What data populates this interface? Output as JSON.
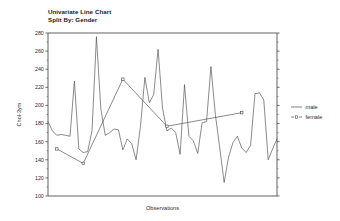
{
  "chart_data": {
    "type": "line",
    "title": "Univariate Line Chart",
    "subtitle": "Split By: Gender",
    "xlabel": "Observations",
    "ylabel": "Chol-3ym",
    "ylim": [
      100,
      280
    ],
    "ytick_step": 20,
    "yticks": [
      100,
      120,
      140,
      160,
      180,
      200,
      220,
      240,
      260,
      280
    ],
    "ytick_labels": [
      "100",
      "120",
      "140",
      "160",
      "180",
      "200",
      "220",
      "240",
      "260",
      "280"
    ],
    "xticks_visible": false,
    "grid": false,
    "legend_position": "right",
    "series": [
      {
        "name": "male",
        "style": "solid",
        "marker": "none",
        "color": "#4a4a52",
        "x": [
          0,
          1,
          2,
          3,
          4,
          5,
          6,
          7,
          8,
          9,
          10,
          11,
          12,
          13,
          14,
          15,
          16,
          17,
          18,
          19,
          20,
          21,
          22,
          23,
          24,
          25,
          26,
          27,
          28,
          29,
          30,
          31,
          32,
          33,
          34,
          35,
          36,
          37,
          38,
          39,
          40,
          41,
          42,
          43,
          44,
          45,
          46,
          47,
          48,
          49,
          50,
          51,
          52
        ],
        "values": [
          182,
          172,
          167,
          168,
          167,
          166,
          227,
          152,
          148,
          149,
          172,
          276,
          196,
          167,
          170,
          174,
          173,
          151,
          163,
          158,
          140,
          177,
          231,
          203,
          212,
          262,
          197,
          172,
          175,
          170,
          146,
          223,
          166,
          161,
          147,
          181,
          182,
          243,
          190,
          153,
          115,
          143,
          159,
          166,
          153,
          148,
          156,
          213,
          214,
          206,
          140,
          152,
          163
        ]
      },
      {
        "name": "female",
        "style": "dashed",
        "marker": "square",
        "color": "#4a4a52",
        "x": [
          2,
          8,
          17,
          27,
          44
        ],
        "values": [
          152,
          136,
          229,
          177,
          192
        ]
      }
    ],
    "legend": [
      {
        "label": "male",
        "style": "solid",
        "marker": "none"
      },
      {
        "label": "female",
        "style": "dashed",
        "marker": "square"
      }
    ]
  }
}
